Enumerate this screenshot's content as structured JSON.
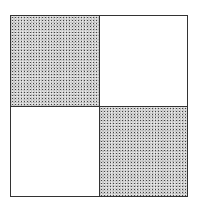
{
  "diagram": {
    "type": "2x2 checkerboard grid",
    "border_color": "#333333",
    "cells": [
      {
        "row": 0,
        "col": 0,
        "fill": "stippled"
      },
      {
        "row": 0,
        "col": 1,
        "fill": "blank"
      },
      {
        "row": 1,
        "col": 0,
        "fill": "blank"
      },
      {
        "row": 1,
        "col": 1,
        "fill": "stippled"
      }
    ],
    "colors": {
      "stipple_base": "#c8c8c8",
      "blank": "#ffffff"
    }
  }
}
